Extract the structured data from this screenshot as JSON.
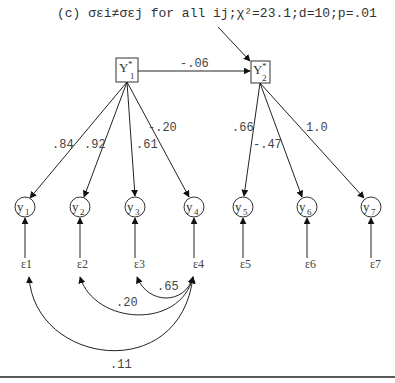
{
  "caption": {
    "prefix": "(c) ",
    "text": "σεi≠σεj for all ij;χ²=23.1;d=10;p=.01",
    "chi_square": "23.1",
    "df": "10",
    "p": ".01"
  },
  "latent": [
    {
      "id": "Y1*",
      "label": "Y",
      "sup": "*",
      "sub": "1"
    },
    {
      "id": "Y2*",
      "label": "Y",
      "sup": "*",
      "sub": "2"
    }
  ],
  "structural_path": {
    "from": "Y1*",
    "to": "Y2*",
    "coef": "-.06"
  },
  "observed": [
    {
      "id": "y1",
      "label": "y",
      "sub": "1"
    },
    {
      "id": "y2",
      "label": "y",
      "sub": "2"
    },
    {
      "id": "y3",
      "label": "y",
      "sub": "3"
    },
    {
      "id": "y4",
      "label": "y",
      "sub": "4"
    },
    {
      "id": "y5",
      "label": "y",
      "sub": "5"
    },
    {
      "id": "y6",
      "label": "y",
      "sub": "6"
    },
    {
      "id": "y7",
      "label": "y",
      "sub": "7"
    }
  ],
  "loadings": [
    {
      "from": "Y1*",
      "to": "y1",
      "coef": ".84"
    },
    {
      "from": "Y1*",
      "to": "y2",
      "coef": ".92"
    },
    {
      "from": "Y1*",
      "to": "y3",
      "coef": ".61"
    },
    {
      "from": "Y1*",
      "to": "y4",
      "coef": "-.20"
    },
    {
      "from": "Y2*",
      "to": "y5",
      "coef": ".66"
    },
    {
      "from": "Y2*",
      "to": "y6",
      "coef": "-.47"
    },
    {
      "from": "Y2*",
      "to": "y7",
      "coef": "1.0"
    }
  ],
  "errors": [
    {
      "id": "ε1",
      "label": "ε1"
    },
    {
      "id": "ε2",
      "label": "ε2"
    },
    {
      "id": "ε3",
      "label": "ε3"
    },
    {
      "id": "ε4",
      "label": "ε4"
    },
    {
      "id": "ε5",
      "label": "ε5"
    },
    {
      "id": "ε6",
      "label": "ε6"
    },
    {
      "id": "ε7",
      "label": "ε7"
    }
  ],
  "error_correlations": [
    {
      "from": "ε4",
      "to": "ε3",
      "coef": ".65"
    },
    {
      "from": "ε4",
      "to": "ε2",
      "coef": ".20"
    },
    {
      "from": "ε4",
      "to": "ε1",
      "coef": ".11"
    }
  ]
}
